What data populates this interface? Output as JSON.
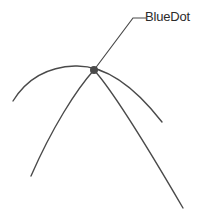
{
  "diagram": {
    "background_color": "#ffffff",
    "stroke_color": "#4a4a4a",
    "label_color": "#2b2b2b",
    "marker": {
      "name": "BlueDot",
      "color": "#4a4a4a",
      "x": 94,
      "y": 70,
      "radius": 4
    },
    "callout": {
      "label": "BlueDot",
      "leader_color": "#4a4a4a",
      "leader_points": "94,70 133,18 146,18"
    },
    "curves": [
      {
        "name": "wide-flat-parabola",
        "stroke_width": 1.4,
        "path": "M13,101 C26,80 46,67 75,66 C104,65 134,86 162,122"
      },
      {
        "name": "narrow-steep-parabola",
        "stroke_width": 1.4,
        "path": "M31,176 C52,128 76,90 94,70 C112,90 148,148 183,208"
      }
    ]
  }
}
